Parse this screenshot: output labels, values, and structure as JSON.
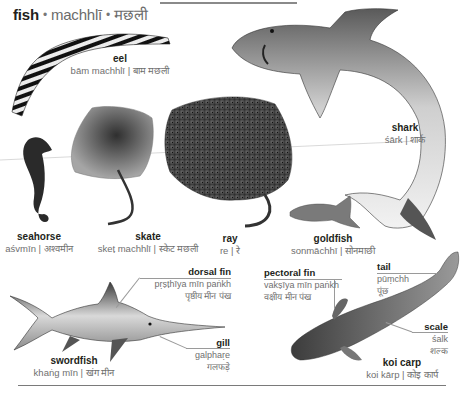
{
  "header": {
    "title_en": "fish",
    "title_translit": "machhlī",
    "title_hindi": "मछली",
    "separator": "•"
  },
  "species": [
    {
      "id": "eel",
      "en": "eel",
      "translit": "bām machhlī",
      "hindi": "बाम मछली"
    },
    {
      "id": "shark",
      "en": "shark",
      "translit": "śārk",
      "hindi": "शार्क"
    },
    {
      "id": "seahorse",
      "en": "seahorse",
      "translit": "aśvmīn",
      "hindi": "अश्वमीन"
    },
    {
      "id": "skate",
      "en": "skate",
      "translit": "skeṭ machhlī",
      "hindi": "स्केट मछली"
    },
    {
      "id": "ray",
      "en": "ray",
      "translit": "re",
      "hindi": "रे"
    },
    {
      "id": "goldfish",
      "en": "goldfish",
      "translit": "sonmāchhī",
      "hindi": "सोनमाछी"
    },
    {
      "id": "swordfish",
      "en": "swordfish",
      "translit": "khaṅg mīn",
      "hindi": "खंग मीन"
    },
    {
      "id": "koi",
      "en": "koi carp",
      "translit": "koi kārp",
      "hindi": "कोइ कार्प"
    }
  ],
  "parts": [
    {
      "id": "dorsal_fin",
      "en": "dorsal fin",
      "translit": "pṛṣṭhīya mīn paṅkh",
      "hindi": "पृष्ठीय मीन पंख"
    },
    {
      "id": "gill",
      "en": "gill",
      "translit": "galphaṛe",
      "hindi": "गलफड़े"
    },
    {
      "id": "pectoral_fin",
      "en": "pectoral fin",
      "translit": "vakṣīya mīn paṅkh",
      "hindi": "वक्षीय मीन पंख"
    },
    {
      "id": "tail",
      "en": "tail",
      "translit": "pūṃchh",
      "hindi": "पूंछ"
    },
    {
      "id": "scale",
      "en": "scale",
      "translit": "śalk",
      "hindi": "शल्क"
    }
  ],
  "colors": {
    "text_primary": "#231f20",
    "text_secondary": "#6f6f6f",
    "rule": "#8a8a8a"
  }
}
